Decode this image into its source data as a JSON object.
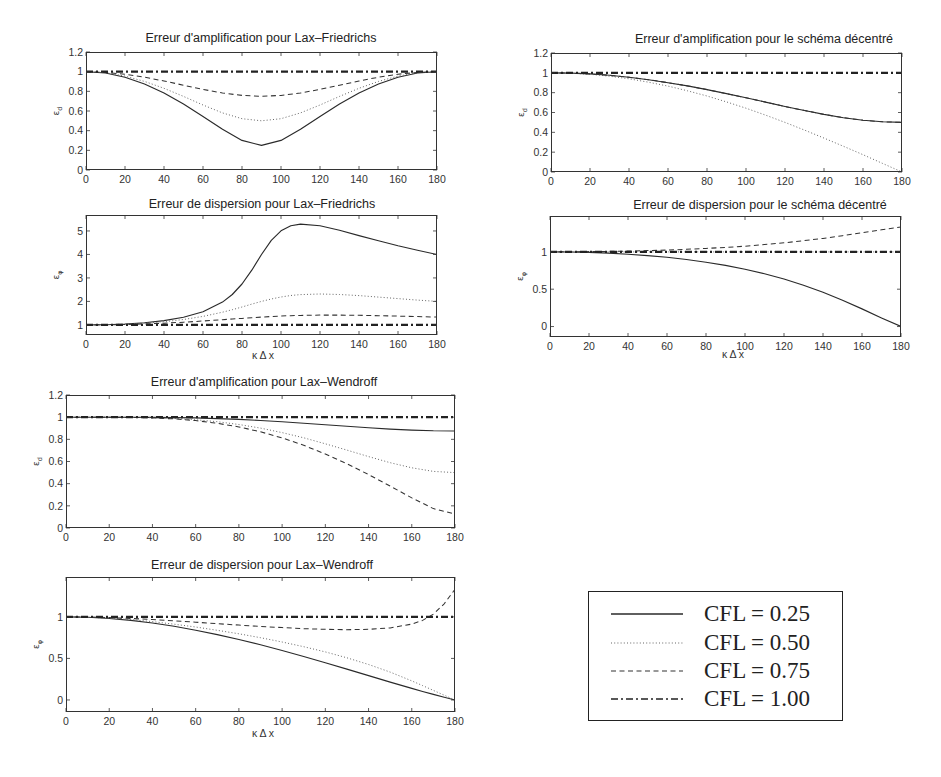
{
  "legend": {
    "entries": [
      {
        "label": "CFL = 0.25",
        "style": "solid"
      },
      {
        "label": "CFL = 0.50",
        "style": "dotted"
      },
      {
        "label": "CFL = 0.75",
        "style": "dashed"
      },
      {
        "label": "CFL = 1.00",
        "style": "dashdot"
      }
    ],
    "position": "bottom-right"
  },
  "chart_data": [
    {
      "type": "line",
      "title": "Erreur d'amplification pour Lax–Friedrichs",
      "xlabel": "",
      "ylabel": "ε_d",
      "xlim": [
        0,
        180
      ],
      "ylim": [
        0,
        1.2
      ],
      "grid": false,
      "xticks": {
        "values": [
          0,
          20,
          40,
          60,
          80,
          100,
          120,
          140,
          160,
          180
        ],
        "labels": [
          "0",
          "20",
          "40",
          "60",
          "80",
          "100",
          "120",
          "140",
          "160",
          "180"
        ]
      },
      "yticks": {
        "values": [
          0,
          0.2,
          0.4,
          0.6,
          0.8,
          1,
          1.2
        ],
        "labels": [
          "0",
          "0.2",
          "0.4",
          "0.6",
          "0.8",
          "1",
          "1.2"
        ]
      },
      "x": [
        0,
        10,
        20,
        30,
        40,
        50,
        60,
        70,
        80,
        90,
        100,
        110,
        120,
        130,
        140,
        150,
        160,
        170,
        180
      ],
      "series": [
        {
          "name": "CFL = 0.25",
          "style": "solid",
          "y": [
            1,
            0.986,
            0.944,
            0.875,
            0.783,
            0.671,
            0.545,
            0.415,
            0.301,
            0.25,
            0.301,
            0.415,
            0.545,
            0.671,
            0.783,
            0.875,
            0.944,
            0.986,
            1
          ]
        },
        {
          "name": "CFL = 0.50",
          "style": "dotted",
          "y": [
            1,
            0.989,
            0.955,
            0.901,
            0.831,
            0.748,
            0.661,
            0.581,
            0.522,
            0.5,
            0.522,
            0.581,
            0.661,
            0.748,
            0.831,
            0.901,
            0.955,
            0.989,
            1
          ]
        },
        {
          "name": "CFL = 0.75",
          "style": "dashed",
          "y": [
            1,
            0.993,
            0.974,
            0.944,
            0.905,
            0.862,
            0.82,
            0.783,
            0.759,
            0.75,
            0.759,
            0.783,
            0.82,
            0.862,
            0.905,
            0.944,
            0.974,
            0.993,
            1
          ]
        },
        {
          "name": "CFL = 1.00",
          "style": "dashdot",
          "y": [
            1,
            1,
            1,
            1,
            1,
            1,
            1,
            1,
            1,
            1,
            1,
            1,
            1,
            1,
            1,
            1,
            1,
            1,
            1
          ]
        }
      ]
    },
    {
      "type": "line",
      "title": "Erreur d'amplification pour le schéma décentré",
      "xlabel": "",
      "ylabel": "ε_d",
      "xlim": [
        0,
        180
      ],
      "ylim": [
        0,
        1.2
      ],
      "grid": false,
      "xticks": {
        "values": [
          0,
          20,
          40,
          60,
          80,
          100,
          120,
          140,
          160,
          180
        ],
        "labels": [
          "0",
          "20",
          "40",
          "60",
          "80",
          "100",
          "120",
          "140",
          "160",
          "180"
        ]
      },
      "yticks": {
        "values": [
          0,
          0.2,
          0.4,
          0.6,
          0.8,
          1,
          1.2
        ],
        "labels": [
          "0",
          "0.2",
          "0.4",
          "0.6",
          "0.8",
          "1",
          "1.2"
        ]
      },
      "x": [
        0,
        10,
        20,
        30,
        40,
        50,
        60,
        70,
        80,
        90,
        100,
        110,
        120,
        130,
        140,
        150,
        160,
        170,
        180
      ],
      "series": [
        {
          "name": "CFL = 0.25",
          "style": "solid",
          "y": [
            1,
            0.997,
            0.989,
            0.975,
            0.955,
            0.931,
            0.901,
            0.868,
            0.831,
            0.791,
            0.748,
            0.705,
            0.661,
            0.62,
            0.581,
            0.548,
            0.522,
            0.506,
            0.5
          ]
        },
        {
          "name": "CFL = 0.50",
          "style": "dotted",
          "y": [
            1,
            0.996,
            0.985,
            0.966,
            0.94,
            0.906,
            0.866,
            0.819,
            0.766,
            0.707,
            0.643,
            0.574,
            0.5,
            0.423,
            0.342,
            0.259,
            0.174,
            0.087,
            0
          ]
        },
        {
          "name": "CFL = 0.75",
          "style": "dashed",
          "y": [
            1,
            0.997,
            0.989,
            0.975,
            0.955,
            0.931,
            0.901,
            0.868,
            0.831,
            0.791,
            0.748,
            0.705,
            0.661,
            0.62,
            0.581,
            0.548,
            0.522,
            0.506,
            0.5
          ]
        },
        {
          "name": "CFL = 1.00",
          "style": "dashdot",
          "y": [
            1,
            1,
            1,
            1,
            1,
            1,
            1,
            1,
            1,
            1,
            1,
            1,
            1,
            1,
            1,
            1,
            1,
            1,
            1
          ]
        }
      ]
    },
    {
      "type": "line",
      "title": "Erreur de dispersion pour Lax–Friedrichs",
      "xlabel": "κ Δ x",
      "ylabel": "ε_φ",
      "xlim": [
        0,
        180
      ],
      "ylim": [
        0.57,
        5.68
      ],
      "grid": false,
      "xticks": {
        "values": [
          0,
          20,
          40,
          60,
          80,
          100,
          120,
          140,
          160,
          180
        ],
        "labels": [
          "0",
          "20",
          "40",
          "60",
          "80",
          "100",
          "120",
          "140",
          "160",
          "180"
        ]
      },
      "yticks": {
        "values": [
          1,
          2,
          3,
          4,
          5
        ],
        "labels": [
          "1",
          "2",
          "3",
          "4",
          "5"
        ]
      },
      "x": [
        0,
        10,
        20,
        30,
        40,
        50,
        60,
        70,
        75,
        80,
        85,
        90,
        95,
        100,
        105,
        110,
        120,
        130,
        140,
        150,
        160,
        170,
        180
      ],
      "series": [
        {
          "name": "CFL = 0.25",
          "style": "solid",
          "y": [
            1,
            1.01,
            1.04,
            1.095,
            1.185,
            1.327,
            1.562,
            1.97,
            2.294,
            2.741,
            3.328,
            4.0,
            4.601,
            5.007,
            5.219,
            5.292,
            5.219,
            5.028,
            4.804,
            4.581,
            4.37,
            4.176,
            4.0
          ]
        },
        {
          "name": "CFL = 0.50",
          "style": "dotted",
          "y": [
            1,
            1.008,
            1.032,
            1.073,
            1.138,
            1.232,
            1.363,
            1.542,
            1.648,
            1.764,
            1.884,
            2.0,
            2.104,
            2.189,
            2.251,
            2.292,
            2.318,
            2.295,
            2.246,
            2.185,
            2.121,
            2.058,
            2.0
          ]
        },
        {
          "name": "CFL = 0.75",
          "style": "dashed",
          "y": [
            1,
            1.005,
            1.018,
            1.041,
            1.073,
            1.115,
            1.165,
            1.221,
            1.251,
            1.279,
            1.307,
            1.333,
            1.357,
            1.377,
            1.392,
            1.405,
            1.418,
            1.417,
            1.408,
            1.392,
            1.373,
            1.353,
            1.333
          ]
        },
        {
          "name": "CFL = 1.00",
          "style": "dashdot",
          "y": [
            1,
            1,
            1,
            1,
            1,
            1,
            1,
            1,
            1,
            1,
            1,
            1,
            1,
            1,
            1,
            1,
            1,
            1,
            1,
            1,
            1,
            1,
            1
          ]
        }
      ]
    },
    {
      "type": "line",
      "title": "Erreur de dispersion pour le schéma décentré",
      "xlabel": "κ Δ x",
      "ylabel": "ε_φ",
      "xlim": [
        0,
        180
      ],
      "ylim": [
        -0.14,
        1.48
      ],
      "grid": false,
      "xticks": {
        "values": [
          0,
          20,
          40,
          60,
          80,
          100,
          120,
          140,
          160,
          180
        ],
        "labels": [
          "0",
          "20",
          "40",
          "60",
          "80",
          "100",
          "120",
          "140",
          "160",
          "180"
        ]
      },
      "yticks": {
        "values": [
          0,
          0.5,
          1
        ],
        "labels": [
          "0",
          "0.5",
          "1"
        ]
      },
      "x": [
        0,
        10,
        20,
        30,
        40,
        50,
        60,
        70,
        80,
        90,
        100,
        110,
        120,
        130,
        140,
        150,
        160,
        170,
        180
      ],
      "series": [
        {
          "name": "CFL = 0.25",
          "style": "solid",
          "y": [
            1,
            0.998,
            0.992,
            0.983,
            0.969,
            0.95,
            0.927,
            0.897,
            0.862,
            0.819,
            0.768,
            0.708,
            0.637,
            0.554,
            0.459,
            0.352,
            0.236,
            0.116,
            0
          ]
        },
        {
          "name": "CFL = 0.50",
          "style": "dotted",
          "y": [
            1,
            1,
            1,
            1,
            1,
            1,
            1,
            1,
            1,
            1,
            1,
            1,
            1,
            1,
            1,
            1,
            1,
            1,
            1
          ]
        },
        {
          "name": "CFL = 0.75",
          "style": "dashed",
          "y": [
            1,
            1.001,
            1.003,
            1.006,
            1.01,
            1.017,
            1.024,
            1.034,
            1.046,
            1.06,
            1.076,
            1.097,
            1.121,
            1.149,
            1.18,
            1.216,
            1.255,
            1.295,
            1.333
          ]
        },
        {
          "name": "CFL = 1.00",
          "style": "dashdot",
          "y": [
            1,
            1,
            1,
            1,
            1,
            1,
            1,
            1,
            1,
            1,
            1,
            1,
            1,
            1,
            1,
            1,
            1,
            1,
            1
          ]
        }
      ]
    },
    {
      "type": "line",
      "title": "Erreur d'amplification pour Lax–Wendroff",
      "xlabel": "",
      "ylabel": "ε_d",
      "xlim": [
        0,
        180
      ],
      "ylim": [
        0,
        1.2
      ],
      "grid": false,
      "xticks": {
        "values": [
          0,
          20,
          40,
          60,
          80,
          100,
          120,
          140,
          160,
          180
        ],
        "labels": [
          "0",
          "20",
          "40",
          "60",
          "80",
          "100",
          "120",
          "140",
          "160",
          "180"
        ]
      },
      "yticks": {
        "values": [
          0,
          0.2,
          0.4,
          0.6,
          0.8,
          1,
          1.2
        ],
        "labels": [
          "0",
          "0.2",
          "0.4",
          "0.6",
          "0.8",
          "1",
          "1.2"
        ]
      },
      "x": [
        0,
        10,
        20,
        30,
        40,
        50,
        60,
        70,
        80,
        90,
        100,
        110,
        120,
        130,
        140,
        150,
        160,
        170,
        180
      ],
      "series": [
        {
          "name": "CFL = 0.25",
          "style": "solid",
          "y": [
            1,
            1,
            1,
            0.999,
            0.998,
            0.996,
            0.993,
            0.987,
            0.98,
            0.97,
            0.959,
            0.946,
            0.932,
            0.918,
            0.904,
            0.892,
            0.883,
            0.877,
            0.875
          ]
        },
        {
          "name": "CFL = 0.50",
          "style": "dotted",
          "y": [
            1,
            1,
            1,
            0.998,
            0.995,
            0.988,
            0.976,
            0.959,
            0.934,
            0.901,
            0.861,
            0.814,
            0.76,
            0.703,
            0.644,
            0.589,
            0.543,
            0.511,
            0.5
          ]
        },
        {
          "name": "CFL = 0.75",
          "style": "dashed",
          "y": [
            1,
            1,
            1,
            0.998,
            0.993,
            0.984,
            0.969,
            0.945,
            0.912,
            0.868,
            0.813,
            0.746,
            0.668,
            0.58,
            0.482,
            0.378,
            0.272,
            0.175,
            0.125
          ]
        },
        {
          "name": "CFL = 1.00",
          "style": "dashdot",
          "y": [
            1,
            1,
            1,
            1,
            1,
            1,
            1,
            1,
            1,
            1,
            1,
            1,
            1,
            1,
            1,
            1,
            1,
            1,
            1
          ]
        }
      ]
    },
    {
      "type": "line",
      "title": "Erreur de dispersion pour Lax–Wendroff",
      "xlabel": "κ Δ x",
      "ylabel": "ε_φ",
      "xlim": [
        0,
        180
      ],
      "ylim": [
        -0.145,
        1.48
      ],
      "grid": false,
      "xticks": {
        "values": [
          0,
          20,
          40,
          60,
          80,
          100,
          120,
          140,
          160,
          180
        ],
        "labels": [
          "0",
          "20",
          "40",
          "60",
          "80",
          "100",
          "120",
          "140",
          "160",
          "180"
        ]
      },
      "yticks": {
        "values": [
          0,
          0.5,
          1
        ],
        "labels": [
          "0",
          "0.5",
          "1"
        ]
      },
      "x": [
        0,
        10,
        20,
        30,
        40,
        50,
        60,
        70,
        80,
        90,
        100,
        110,
        120,
        130,
        140,
        150,
        160,
        165,
        170,
        175,
        180
      ],
      "series": [
        {
          "name": "CFL = 0.25",
          "style": "solid",
          "y": [
            1,
            0.995,
            0.981,
            0.958,
            0.926,
            0.887,
            0.84,
            0.787,
            0.728,
            0.664,
            0.595,
            0.523,
            0.448,
            0.371,
            0.293,
            0.215,
            0.139,
            0.102,
            0.067,
            0.033,
            0
          ]
        },
        {
          "name": "CFL = 0.50",
          "style": "dotted",
          "y": [
            1,
            0.996,
            0.985,
            0.967,
            0.943,
            0.912,
            0.878,
            0.839,
            0.796,
            0.749,
            0.697,
            0.641,
            0.578,
            0.508,
            0.427,
            0.335,
            0.229,
            0.173,
            0.115,
            0.057,
            0
          ]
        },
        {
          "name": "CFL = 0.75",
          "style": "dashed",
          "y": [
            1,
            0.998,
            0.991,
            0.981,
            0.968,
            0.952,
            0.936,
            0.918,
            0.901,
            0.885,
            0.871,
            0.858,
            0.85,
            0.846,
            0.85,
            0.867,
            0.913,
            0.958,
            1.034,
            1.158,
            1.333
          ]
        },
        {
          "name": "CFL = 1.00",
          "style": "dashdot",
          "y": [
            1,
            1,
            1,
            1,
            1,
            1,
            1,
            1,
            1,
            1,
            1,
            1,
            1,
            1,
            1,
            1,
            1,
            1,
            1,
            1,
            1
          ]
        }
      ]
    }
  ]
}
